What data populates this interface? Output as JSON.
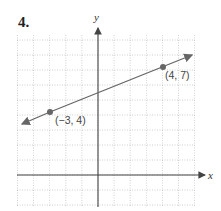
{
  "problem": {
    "number": "4."
  },
  "chart_data": {
    "type": "line",
    "title": "",
    "xlabel": "x",
    "ylabel": "y",
    "xlim": [
      -5,
      6
    ],
    "ylim": [
      -2,
      9
    ],
    "grid": true,
    "series": [
      {
        "name": "line",
        "x": [
          -3,
          4
        ],
        "y": [
          4,
          7
        ],
        "color": "#555555"
      }
    ],
    "points": [
      {
        "x": -3,
        "y": 4,
        "label": "(−3, 4)"
      },
      {
        "x": 4,
        "y": 7,
        "label": "(4, 7)"
      }
    ],
    "annotations": [
      "(−3, 4)",
      "(4, 7)"
    ]
  },
  "labels": {
    "x_axis": "x",
    "y_axis": "y",
    "point_a": "(−3, 4)",
    "point_b": "(4, 7)"
  }
}
